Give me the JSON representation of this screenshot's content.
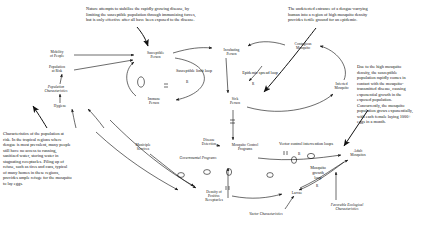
{
  "notes": [
    {
      "id": "note-nature",
      "text": "Nature attempts to stabilize the rapidly growing disease, by\nlimiting the susceptible population through immunizing forces,\nbut is only effective after all have been exposed to the disease.",
      "x": 86,
      "y": 6,
      "w": 180
    },
    {
      "id": "note-undetected",
      "text": "The undetected entrance of a dengue-carrying\nhuman into a region of high mosquito density\nprovides fertile ground for an epidemic.",
      "x": 288,
      "y": 6,
      "w": 150
    },
    {
      "id": "note-density",
      "text": "Due to the high mosquito\ndensity, the susceptible\npopulation rapidly comes in\ncontact with the mosquito-\ntransmitted disease, causing\nexponential growth in the\nexposed population.\nConcurrently, the mosquito\npopulation grows exponentially,\nwith each female laying 1000+\neggs in a month.",
      "x": 357,
      "y": 64,
      "w": 84
    },
    {
      "id": "note-characteristics",
      "text": "Characteristics of the population at\nrisk.  In the tropical regions where\ndengue is most prevalent, many people\nstill have no access to running,\nsanitized water, storing water in\nstagnating receptacles.  Piling up of\nrefuse, such as tires and cans, typical\nof many homes in these regions,\nprovides ample refuge for the mosquito\nto lay eggs.",
      "x": 3,
      "y": 131,
      "w": 118
    }
  ],
  "variables": [
    {
      "id": "mobility-of-people",
      "text": "Mobility\nof People",
      "x": 43,
      "y": 50,
      "w": 28,
      "italic": false
    },
    {
      "id": "population-at-risk",
      "text": "Population\nat Risk",
      "x": 42,
      "y": 65,
      "w": 30,
      "italic": false
    },
    {
      "id": "population-characteristics",
      "text": "Population\nCharacteristics",
      "x": 38,
      "y": 85,
      "w": 36,
      "italic": true
    },
    {
      "id": "hygiene",
      "text": "Hygiene",
      "x": 47,
      "y": 104,
      "w": 26,
      "italic": false
    },
    {
      "id": "susceptible-person",
      "text": "Susceptible\nPerson",
      "x": 139,
      "y": 51,
      "w": 33,
      "italic": false
    },
    {
      "id": "immune-person",
      "text": "Immune\nPerson",
      "x": 140,
      "y": 97,
      "w": 28,
      "italic": false
    },
    {
      "id": "incubating-person",
      "text": "Incubating\nPerson",
      "x": 216,
      "y": 48,
      "w": 31,
      "italic": false
    },
    {
      "id": "contagious-mosquito",
      "text": "Contagious\nMosquito",
      "x": 287,
      "y": 42,
      "w": 32,
      "italic": false
    },
    {
      "id": "sick-person",
      "text": "Sick\nPerson",
      "x": 223,
      "y": 97,
      "w": 24,
      "italic": false
    },
    {
      "id": "infected-mosquito",
      "text": "Infected\nMosquito",
      "x": 327,
      "y": 82,
      "w": 29,
      "italic": false
    },
    {
      "id": "municiple-services",
      "text": "Municiple\nServices",
      "x": 128,
      "y": 143,
      "w": 30,
      "italic": false
    },
    {
      "id": "disease-detection",
      "text": "Disease\nDetection",
      "x": 195,
      "y": 138,
      "w": 28,
      "italic": false
    },
    {
      "id": "governmental-programs",
      "text": "Governmental Programs",
      "x": 165,
      "y": 156,
      "w": 66,
      "italic": true
    },
    {
      "id": "mosquito-control-programs",
      "text": "Mosquito Control\nPrograms",
      "x": 222,
      "y": 143,
      "w": 46,
      "italic": false
    },
    {
      "id": "density-of-positive-receptacles",
      "text": "Density of\nPositive\nReceptacles",
      "x": 197,
      "y": 190,
      "w": 34,
      "italic": false
    },
    {
      "id": "vector-characteristics",
      "text": "Vector Characteristics",
      "x": 235,
      "y": 212,
      "w": 62,
      "italic": true
    },
    {
      "id": "larvae",
      "text": "Larvae",
      "x": 285,
      "y": 191,
      "w": 24,
      "italic": false
    },
    {
      "id": "adult-mosquitos",
      "text": "Adult\nMosquitos",
      "x": 343,
      "y": 149,
      "w": 30,
      "italic": false
    },
    {
      "id": "favorable-ecological-characteristics",
      "text": "Favorable Ecological\nCharacteristics",
      "x": 317,
      "y": 203,
      "w": 60,
      "italic": true
    }
  ],
  "loops": [
    {
      "id": "susceptible-limit-loop",
      "text": "Susceptible limit loop",
      "symbol": "B",
      "x": 163,
      "y": 69,
      "w": 62,
      "sx": 186,
      "sy": 80
    },
    {
      "id": "epidemic-spread-loop",
      "text": "Epidemic spread loop",
      "symbol": "R",
      "x": 230,
      "y": 71,
      "w": 60,
      "sx": 252,
      "sy": 82
    },
    {
      "id": "vector-control-intervention-loops",
      "text": "Vector control intervention loops",
      "symbol": "B",
      "x": 258,
      "y": 142,
      "w": 96,
      "sx": 298,
      "sy": 152
    },
    {
      "id": "mosquito-growth-loop",
      "text": "Mosquito\ngrowth\nloop",
      "symbol": "R",
      "x": 306,
      "y": 166,
      "w": 24,
      "sx": 316,
      "sy": 184
    }
  ],
  "colors": {
    "ink": "#111111",
    "background": "#ffffff"
  }
}
